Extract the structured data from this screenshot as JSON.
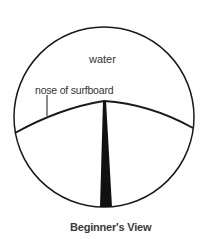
{
  "diagram": {
    "title": "Beginner's View",
    "labels": {
      "water": "water",
      "nose": "nose of surfboard"
    },
    "elements": [
      "circular field of view",
      "horizon / nose curve",
      "surfboard center stringer"
    ],
    "colors": {
      "stroke": "#1a1a1a",
      "text": "#333333",
      "background": "#ffffff"
    }
  }
}
